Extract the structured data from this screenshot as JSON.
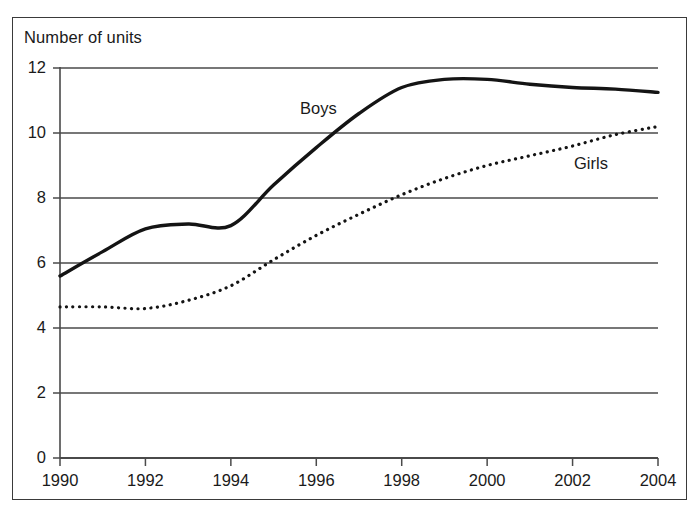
{
  "chart_data": {
    "type": "line",
    "title": "Number of units",
    "xlabel": "",
    "ylabel": "Number of units",
    "xlim": [
      1990,
      2004
    ],
    "ylim": [
      0,
      12
    ],
    "grid": true,
    "legend_position": "inline-labels",
    "y_ticks": [
      0,
      2,
      4,
      6,
      8,
      10,
      12
    ],
    "y_tick_labels": [
      "0",
      "2",
      "4",
      "6",
      "8",
      "10",
      "12"
    ],
    "x_ticks": [
      1990,
      1992,
      1994,
      1996,
      1998,
      2000,
      2002,
      2004
    ],
    "x_tick_labels": [
      "1990",
      "1992",
      "1994",
      "1996",
      "1998",
      "2000",
      "2002",
      "2004"
    ],
    "x": [
      1990,
      1991,
      1992,
      1993,
      1994,
      1995,
      1996,
      1997,
      1998,
      1999,
      2000,
      2001,
      2002,
      2003,
      2004
    ],
    "series": [
      {
        "name": "Boys",
        "style": "solid",
        "color": "#141414",
        "width": 3.4,
        "values": [
          5.6,
          6.35,
          7.05,
          7.2,
          7.15,
          8.4,
          9.55,
          10.6,
          11.4,
          11.65,
          11.65,
          11.5,
          11.4,
          11.35,
          11.25
        ]
      },
      {
        "name": "Girls",
        "style": "dotted",
        "color": "#141414",
        "width": 3.2,
        "values": [
          4.65,
          4.65,
          4.6,
          4.85,
          5.3,
          6.1,
          6.85,
          7.5,
          8.1,
          8.6,
          9.0,
          9.3,
          9.6,
          9.95,
          10.2
        ]
      }
    ],
    "annotations": [
      {
        "text": "Boys",
        "x": 1996.6,
        "y": 10.9
      },
      {
        "text": "Girls",
        "x": 2002.0,
        "y": 9.35
      }
    ]
  },
  "axis": {
    "y_title": "Number of units"
  }
}
